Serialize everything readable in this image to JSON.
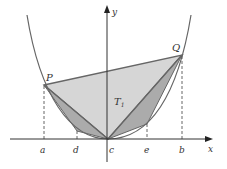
{
  "diagram": {
    "axes": {
      "x_label": "x",
      "y_label": "y"
    },
    "points": {
      "P": "P",
      "Q": "Q"
    },
    "region_label": "T",
    "region_subscript": "1",
    "ticks": [
      "a",
      "d",
      "c",
      "e",
      "b"
    ],
    "colors": {
      "curve": "#555555",
      "large_triangle_fill": "#d4d4d4",
      "small_triangle_fill": "#a8a8a8",
      "edge": "#666666",
      "axis": "#333333"
    }
  }
}
